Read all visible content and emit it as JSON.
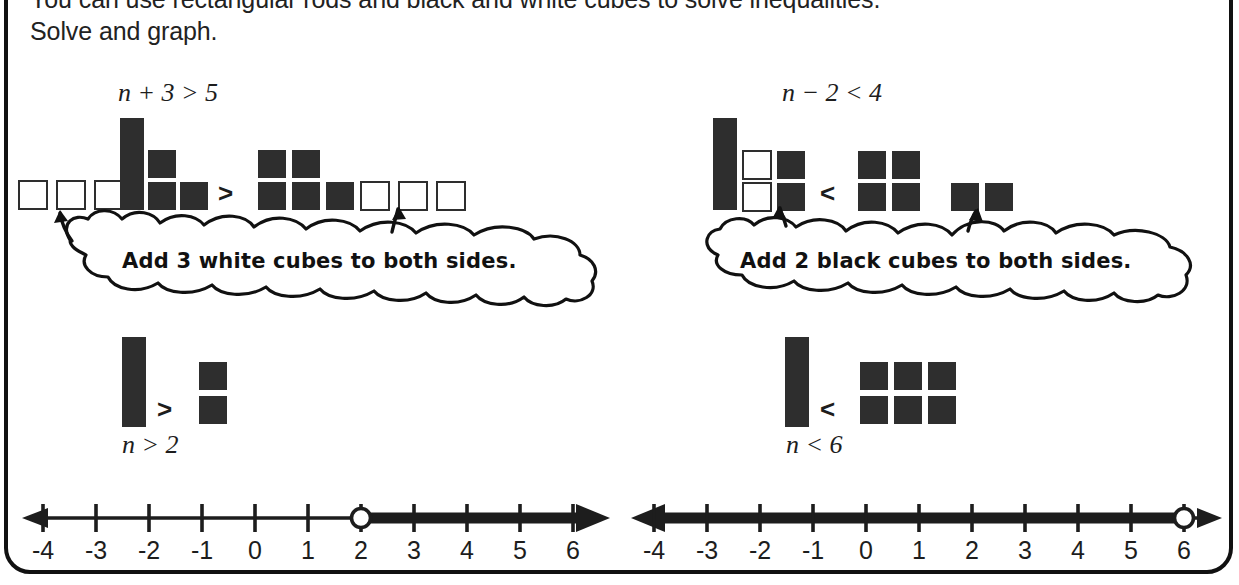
{
  "intro": {
    "line1": "You can use rectangular rods and black and white cubes to solve inequalities.",
    "line2": "Solve and graph."
  },
  "colors": {
    "black_piece": "#2e2e2e",
    "white_piece": "#ffffff",
    "outline": "#2e2e2e",
    "text": "#1d1d1d",
    "frame": "#111111",
    "background": "#ffffff"
  },
  "problems": [
    {
      "id": "left",
      "equation": {
        "variable": "n",
        "operator": "+",
        "operand": "3",
        "relation": ">",
        "constant": "5",
        "full": "n + 3 > 5"
      },
      "step1": {
        "left_side": {
          "white_cubes": 3,
          "rods": 1,
          "black_cubes": 3
        },
        "relation": ">",
        "right_side": {
          "black_cubes": 5,
          "white_cubes": 3
        }
      },
      "callout": "Add 3 white cubes to both sides.",
      "step2": {
        "left_side": {
          "rods": 1
        },
        "relation": ">",
        "right_side": {
          "black_cubes": 2
        }
      },
      "solution": {
        "variable": "n",
        "relation": ">",
        "value": "2",
        "full": "n > 2"
      },
      "numberline": {
        "min": -4,
        "max": 6,
        "ticks": [
          "-4",
          "-3",
          "-2",
          "-1",
          "0",
          "1",
          "2",
          "3",
          "4",
          "5",
          "6"
        ],
        "circle_at": 2,
        "circle_type": "open",
        "shaded_direction": "right"
      }
    },
    {
      "id": "right",
      "equation": {
        "variable": "n",
        "operator": "−",
        "operand": "2",
        "relation": "<",
        "constant": "4",
        "full": "n − 2 < 4"
      },
      "step1": {
        "left_side": {
          "rods": 1,
          "white_cubes": 2,
          "black_cubes": 2
        },
        "relation": "<",
        "right_side": {
          "black_cubes_group1": 4,
          "black_cubes_group2": 2
        }
      },
      "callout": "Add 2 black cubes to both sides.",
      "step2": {
        "left_side": {
          "rods": 1
        },
        "relation": "<",
        "right_side": {
          "black_cubes": 6
        }
      },
      "solution": {
        "variable": "n",
        "relation": "<",
        "value": "6",
        "full": "n < 6"
      },
      "numberline": {
        "min": -4,
        "max": 6,
        "ticks": [
          "-4",
          "-3",
          "-2",
          "-1",
          "0",
          "1",
          "2",
          "3",
          "4",
          "5",
          "6"
        ],
        "circle_at": 6,
        "circle_type": "open",
        "shaded_direction": "left"
      }
    }
  ]
}
